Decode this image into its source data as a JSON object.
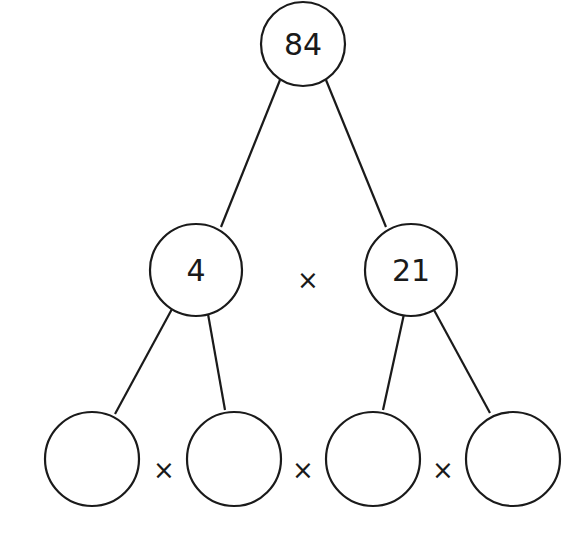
{
  "diagram": {
    "type": "factor-tree",
    "stroke_color": "#1a1a1a",
    "background": "#ffffff",
    "root": {
      "value": "84",
      "cx": 303,
      "cy": 44,
      "r": 42
    },
    "level1": [
      {
        "value": "4",
        "cx": 196,
        "cy": 270,
        "r": 46
      },
      {
        "value": "21",
        "cx": 411,
        "cy": 270,
        "r": 46
      }
    ],
    "level1_operator": {
      "symbol": "×",
      "x": 308,
      "y": 280
    },
    "level2": [
      {
        "value": "",
        "cx": 92,
        "cy": 459,
        "r": 47
      },
      {
        "value": "",
        "cx": 234,
        "cy": 459,
        "r": 47
      },
      {
        "value": "",
        "cx": 373,
        "cy": 459,
        "r": 47
      },
      {
        "value": "",
        "cx": 513,
        "cy": 459,
        "r": 47
      }
    ],
    "level2_operators": [
      {
        "symbol": "×",
        "x": 164,
        "y": 470
      },
      {
        "symbol": "×",
        "x": 303,
        "y": 470
      },
      {
        "symbol": "×",
        "x": 443,
        "y": 470
      }
    ],
    "edges": [
      {
        "from": "root",
        "to": "level1.0",
        "x1": 280,
        "y1": 80,
        "x2": 221,
        "y2": 227
      },
      {
        "from": "root",
        "to": "level1.1",
        "x1": 326,
        "y1": 80,
        "x2": 386,
        "y2": 227
      },
      {
        "from": "level1.0",
        "to": "level2.0",
        "x1": 172,
        "y1": 309,
        "x2": 115,
        "y2": 414
      },
      {
        "from": "level1.0",
        "to": "level2.1",
        "x1": 208,
        "y1": 314,
        "x2": 225,
        "y2": 410
      },
      {
        "from": "level1.1",
        "to": "level2.2",
        "x1": 404,
        "y1": 314,
        "x2": 383,
        "y2": 410
      },
      {
        "from": "level1.1",
        "to": "level2.3",
        "x1": 434,
        "y1": 310,
        "x2": 490,
        "y2": 413
      }
    ]
  }
}
